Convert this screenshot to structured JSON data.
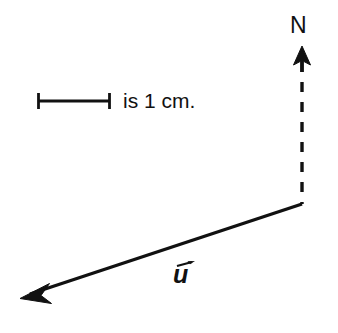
{
  "figure": {
    "type": "vector-diagram",
    "background_color": "#ffffff",
    "stroke_color": "#111111",
    "width": 338,
    "height": 333,
    "labels": {
      "north": "N",
      "scale_text": "is 1 cm.",
      "vector_name": "u"
    },
    "elements": {
      "north_arrow": {
        "name": "north-arrow",
        "tip_x": 302,
        "tip_y": 47,
        "base_y": 62,
        "head_half_width": 8
      },
      "north_dashed_line": {
        "name": "north-dashed-reference-line",
        "x": 302,
        "y_start": 62,
        "y_end": 204,
        "dash_length": 10,
        "gap_length": 10,
        "stroke_width": 3.4
      },
      "scale_bar": {
        "name": "scale-bar",
        "x_start": 38,
        "x_end": 110,
        "y": 101,
        "cap_half_height": 8,
        "length_label": "is 1 cm.",
        "stroke_width": 2.6,
        "cap_stroke_width": 2.6
      },
      "vector_u": {
        "name": "vector-u",
        "tail_x": 302,
        "tail_y": 204,
        "tip_x": 21,
        "tip_y": 297,
        "stroke_width": 3.2,
        "arrowhead_length": 26,
        "arrowhead_half_width": 10
      }
    }
  }
}
